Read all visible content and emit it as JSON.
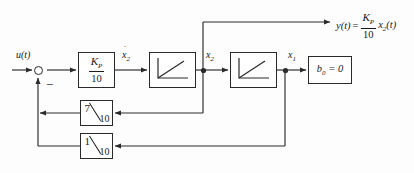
{
  "diagram": {
    "stroke_color": "#2a2a2a",
    "background": "#ffffff",
    "input": {
      "label": "u(t)"
    },
    "summing_junction": {
      "sign_label": "−",
      "name": "summing-junction"
    },
    "blocks": [
      {
        "id": "gain-kp",
        "type": "gain",
        "numerator": "K",
        "numerator_sub": "P",
        "denominator": "10",
        "text": "K_P/10"
      },
      {
        "id": "integrator-1",
        "type": "integrator",
        "text": "integrator"
      },
      {
        "id": "integrator-2",
        "type": "integrator",
        "text": "integrator"
      },
      {
        "id": "output-gain-b0",
        "type": "constant",
        "symbol": "b",
        "symbol_sub": "0",
        "equals": "= 0",
        "text": "b_0 = 0"
      },
      {
        "id": "feedback-7-10",
        "type": "feedback-gain",
        "numerator": "7",
        "denominator": "10",
        "text": "7/10"
      },
      {
        "id": "feedback-1-10",
        "type": "feedback-gain",
        "numerator": "1",
        "denominator": "10",
        "text": "1/10"
      }
    ],
    "signals": {
      "x2_dot": "x",
      "x2_dot_sub": "2",
      "x2": "x",
      "x2_sub": "2",
      "x1": "x",
      "x1_sub": "1"
    },
    "output": {
      "y_label": "y(t)",
      "equals": "=",
      "gain_num": "K",
      "gain_num_sub": "P",
      "gain_den": "10",
      "state": "x",
      "state_sub": "2",
      "state_arg": "(t)"
    }
  }
}
